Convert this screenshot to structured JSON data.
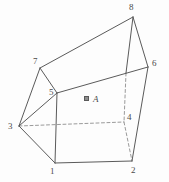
{
  "figure": {
    "type": "3d-polyhedron-line-drawing",
    "canvas": {
      "width": 169,
      "height": 182
    },
    "colors": {
      "background": "#fdfdfd",
      "solid_edge": "#5a5a5a",
      "hidden_edge": "#9a9a9a",
      "label_text": "#4a4a4a"
    },
    "stroke_width": 1,
    "hidden_edge_dash": "3 2.5",
    "vertices": [
      {
        "id": "1",
        "label": "1",
        "x": 55,
        "y": 163,
        "label_x": 50,
        "label_y": 167,
        "hidden": false
      },
      {
        "id": "2",
        "label": "2",
        "x": 132,
        "y": 161,
        "label_x": 131,
        "label_y": 166,
        "hidden": false
      },
      {
        "id": "3",
        "label": "3",
        "x": 19,
        "y": 126,
        "label_x": 8,
        "label_y": 122,
        "hidden": false
      },
      {
        "id": "4",
        "label": "4",
        "x": 124,
        "y": 122,
        "label_x": 127,
        "label_y": 113,
        "hidden": true
      },
      {
        "id": "5",
        "label": "5",
        "x": 57,
        "y": 93,
        "label_x": 49,
        "label_y": 88,
        "hidden": false
      },
      {
        "id": "6",
        "label": "6",
        "x": 148,
        "y": 67,
        "label_x": 152,
        "label_y": 59,
        "hidden": false
      },
      {
        "id": "7",
        "label": "7",
        "x": 40,
        "y": 68,
        "label_x": 33,
        "label_y": 57,
        "hidden": false
      },
      {
        "id": "8",
        "label": "8",
        "x": 133,
        "y": 17,
        "label_x": 129,
        "label_y": 3,
        "hidden": false
      }
    ],
    "solid_edges": [
      {
        "name": "edge-1-2",
        "from": "1",
        "to": "2"
      },
      {
        "name": "edge-1-3",
        "from": "1",
        "to": "3"
      },
      {
        "name": "edge-1-5",
        "from": "1",
        "to": "5"
      },
      {
        "name": "edge-3-5",
        "from": "3",
        "to": "5"
      },
      {
        "name": "edge-3-7",
        "from": "3",
        "to": "7"
      },
      {
        "name": "edge-5-7",
        "from": "5",
        "to": "7"
      },
      {
        "name": "edge-7-8",
        "from": "7",
        "to": "8"
      },
      {
        "name": "edge-8-6",
        "from": "8",
        "to": "6"
      },
      {
        "name": "edge-6-2",
        "from": "6",
        "to": "2"
      },
      {
        "name": "edge-5-6",
        "from": "5",
        "to": "6"
      }
    ],
    "solid_edge_partials": [
      {
        "name": "edge-8-4-visible-part",
        "x1": 133,
        "y1": 17,
        "x2": 126,
        "y2": 73
      }
    ],
    "hidden_edges": [
      {
        "name": "hidden-edge-3-4",
        "from": "3",
        "to": "4"
      },
      {
        "name": "hidden-edge-4-2",
        "from": "4",
        "to": "2"
      },
      {
        "name": "hidden-edge-4-8",
        "x1": 126,
        "y1": 73,
        "x2": 124,
        "y2": 122
      }
    ],
    "face_label": {
      "text": "A",
      "marker_name": "face-marker-icon",
      "marker_x": 84,
      "marker_y": 96,
      "text_x": 93,
      "text_y": 95
    }
  }
}
